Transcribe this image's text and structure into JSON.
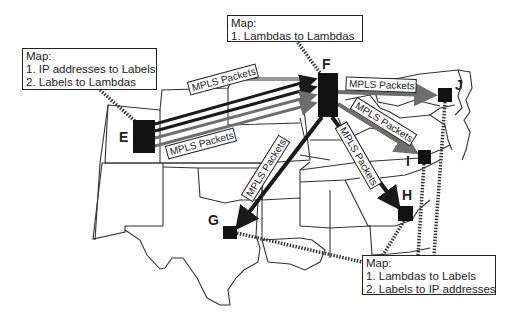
{
  "diagram": {
    "type": "MPLS over optical network map (US)",
    "nodes": [
      {
        "id": "E",
        "label": "E"
      },
      {
        "id": "F",
        "label": "F"
      },
      {
        "id": "G",
        "label": "G"
      },
      {
        "id": "H",
        "label": "H"
      },
      {
        "id": "I",
        "label": "I"
      },
      {
        "id": "J",
        "label": "J"
      }
    ],
    "map_boxes": {
      "ingress": {
        "title": "Map:",
        "line1": "1. IP addresses to Labels",
        "line2": "2. Labels to Lambdas",
        "attached_to": "E"
      },
      "core": {
        "title": "Map:",
        "line1": "1. Lambdas to Lambdas",
        "attached_to": "F"
      },
      "egress": {
        "title": "Map:",
        "line1": "1. Lambdas to Labels",
        "line2": "2. Labels to IP addresses",
        "attached_to": [
          "G",
          "H",
          "I",
          "J"
        ]
      }
    },
    "links": [
      {
        "from": "E",
        "to": "F",
        "label": "MPLS Packets"
      },
      {
        "from": "E",
        "to": "F",
        "label": "MPLS Packets"
      },
      {
        "from": "F",
        "to": "J",
        "label": "MPLS Packets"
      },
      {
        "from": "F",
        "to": "I",
        "label": "MPLS Packets"
      },
      {
        "from": "F",
        "to": "H",
        "label": "MPLS Packets"
      },
      {
        "from": "F",
        "to": "G",
        "label": "MPLS Packets"
      }
    ],
    "packet_label": "MPLS Packets",
    "colors": {
      "dark_link": "#1a1a1a",
      "gray_link": "#6e6e6e",
      "node": "#111111",
      "border": "#222222"
    }
  }
}
